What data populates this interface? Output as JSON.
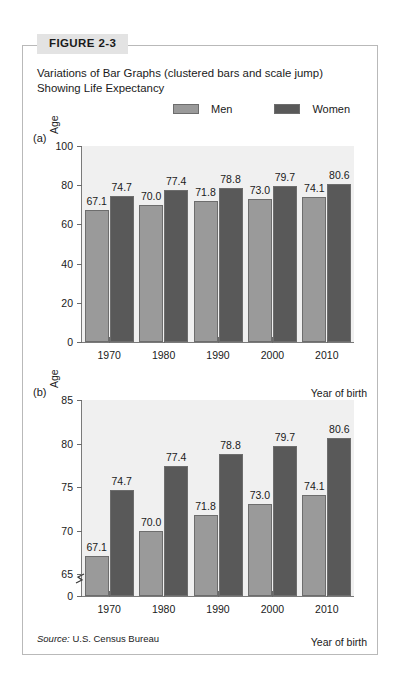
{
  "figure": {
    "tab_label": "FIGURE 2-3",
    "title": "Variations of Bar Graphs (clustered bars and scale jump) Showing Life Expectancy",
    "source_prefix": "Source:",
    "source_text": "U.S. Census Bureau"
  },
  "legend": {
    "items": [
      {
        "label": "Men",
        "color": "#9a9a9a"
      },
      {
        "label": "Women",
        "color": "#595959"
      }
    ]
  },
  "panels": [
    {
      "tag": "(a)"
    },
    {
      "tag": "(b)"
    }
  ],
  "chart_data": [
    {
      "type": "bar",
      "panel": "(a)",
      "title": "",
      "xlabel": "Year of birth",
      "ylabel": "Age",
      "categories": [
        "1970",
        "1980",
        "1990",
        "2000",
        "2010"
      ],
      "series": [
        {
          "name": "Men",
          "values": [
            67.1,
            70.0,
            71.8,
            73.0,
            74.1
          ]
        },
        {
          "name": "Women",
          "values": [
            74.7,
            77.4,
            78.8,
            79.7,
            80.6
          ]
        }
      ],
      "ylim": [
        0,
        100
      ],
      "yticks": [
        0,
        20,
        40,
        60,
        80,
        100
      ],
      "grid": false,
      "scale_break": false,
      "legend_position": "top"
    },
    {
      "type": "bar",
      "panel": "(b)",
      "title": "",
      "xlabel": "Year of birth",
      "ylabel": "Age",
      "categories": [
        "1970",
        "1980",
        "1990",
        "2000",
        "2010"
      ],
      "series": [
        {
          "name": "Men",
          "values": [
            67.1,
            70.0,
            71.8,
            73.0,
            74.1
          ]
        },
        {
          "name": "Women",
          "values": [
            74.7,
            77.4,
            78.8,
            79.7,
            80.6
          ]
        }
      ],
      "ylim": [
        0,
        85
      ],
      "yticks": [
        0,
        65,
        70,
        75,
        80,
        85
      ],
      "grid": false,
      "scale_break": true,
      "scale_break_between": [
        0,
        65
      ],
      "legend_position": "top"
    }
  ]
}
